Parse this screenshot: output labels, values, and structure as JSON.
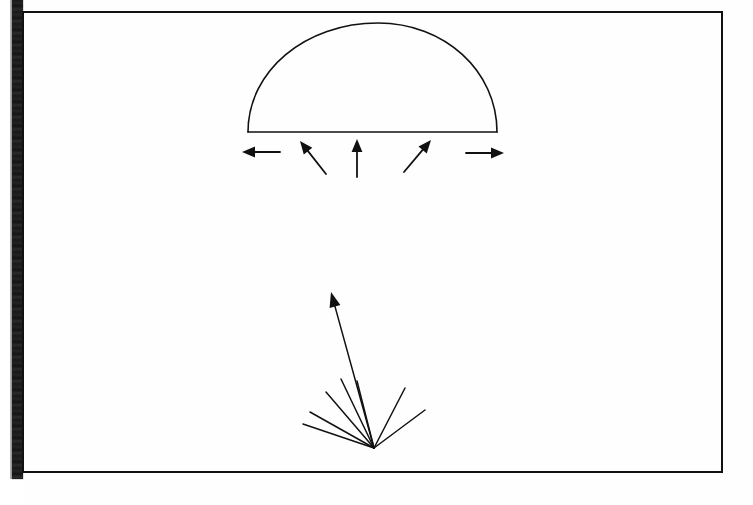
{
  "page": {
    "kind": "scanned-textbook-figure-page",
    "background_color": "#ffffff",
    "ink_color": "#111111",
    "gutter_color": "#202020",
    "border": {
      "left": 23,
      "top": 12,
      "right": 722,
      "bottom": 472,
      "stroke_width": 2
    },
    "text_labels": []
  },
  "figure_upper": {
    "name": "dome-with-outward-arrows",
    "baseline": {
      "x1": 248,
      "y1": 132,
      "x2": 497,
      "y2": 132
    },
    "dome": {
      "apex_x": 378,
      "apex_y": 23,
      "left_x": 248,
      "right_x": 497,
      "base_y": 132
    },
    "arrows": [
      {
        "id": "arrow-left",
        "direction": "left",
        "x1": 280,
        "y1": 152,
        "x2": 242,
        "y2": 152
      },
      {
        "id": "arrow-up-left",
        "direction": "up-left",
        "x1": 326,
        "y1": 174,
        "x2": 300,
        "y2": 141
      },
      {
        "id": "arrow-up",
        "direction": "up",
        "x1": 357,
        "y1": 177,
        "x2": 357,
        "y2": 139
      },
      {
        "id": "arrow-up-right",
        "direction": "up-right",
        "x1": 404,
        "y1": 172,
        "x2": 431,
        "y2": 140
      },
      {
        "id": "arrow-right",
        "direction": "right",
        "x1": 466,
        "y1": 153,
        "x2": 504,
        "y2": 153
      }
    ]
  },
  "figure_lower": {
    "name": "ray-fan-burst",
    "origin": {
      "x": 374,
      "y": 448
    },
    "rays": [
      {
        "id": "ray-1",
        "x2": 303,
        "y2": 424,
        "arrowhead": false
      },
      {
        "id": "ray-2",
        "x2": 310,
        "y2": 412,
        "arrowhead": false
      },
      {
        "id": "ray-3",
        "x2": 326,
        "y2": 392,
        "arrowhead": false
      },
      {
        "id": "ray-4",
        "x2": 341,
        "y2": 379,
        "arrowhead": false
      },
      {
        "id": "ray-5",
        "x2": 331,
        "y2": 292,
        "arrowhead": true
      },
      {
        "id": "ray-6",
        "x2": 357,
        "y2": 381,
        "arrowhead": false
      },
      {
        "id": "ray-7",
        "x2": 405,
        "y2": 388,
        "arrowhead": false
      },
      {
        "id": "ray-8",
        "x2": 425,
        "y2": 410,
        "arrowhead": false
      }
    ]
  }
}
